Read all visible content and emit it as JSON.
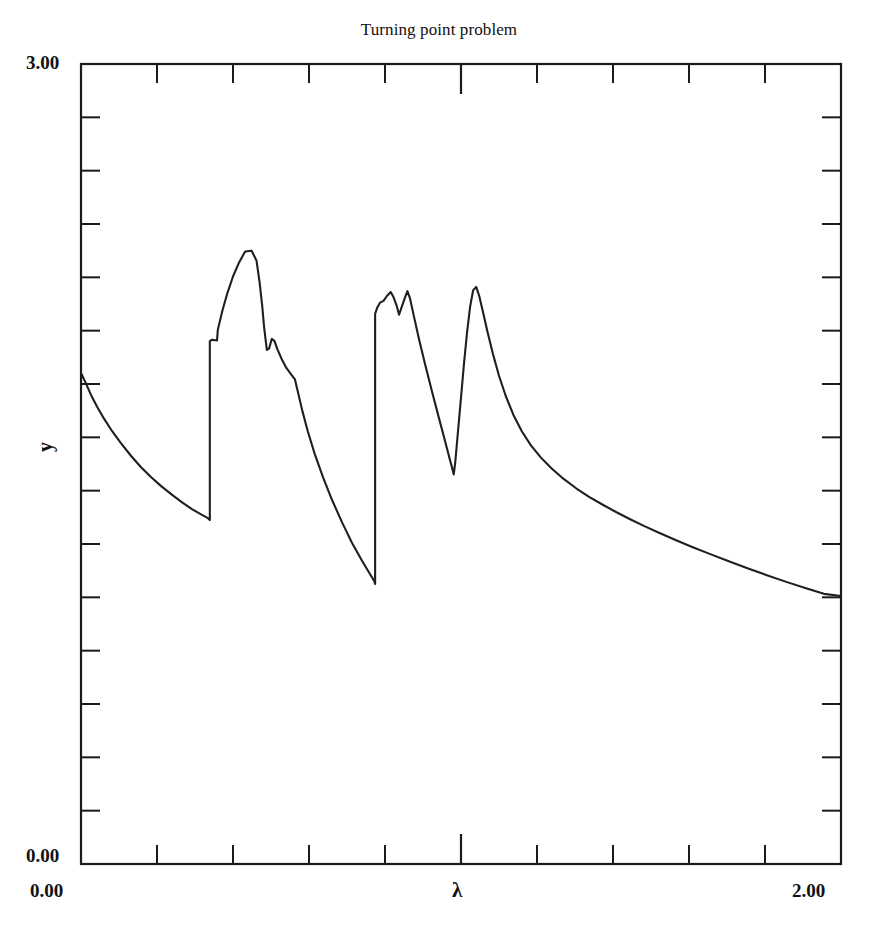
{
  "chart_data": {
    "type": "line",
    "title": "Turning point problem",
    "xlabel": "λ",
    "ylabel": "y",
    "xlim": [
      0.0,
      2.0
    ],
    "ylim": [
      0.0,
      3.0
    ],
    "grid": false,
    "legend": null,
    "x_tick_labels": [
      "0.00",
      "2.00"
    ],
    "y_tick_labels": [
      "0.00",
      "3.00"
    ],
    "x_tick_values": [
      0.0,
      0.2,
      0.4,
      0.6,
      0.8,
      1.0,
      1.2,
      1.4,
      1.6,
      1.8,
      2.0
    ],
    "y_tick_values": [
      0.0,
      0.2,
      0.4,
      0.6,
      0.8,
      1.0,
      1.2,
      1.4,
      1.6,
      1.8,
      2.0,
      2.2,
      2.4,
      2.6,
      2.8,
      3.0
    ],
    "x_major_tick_values": [
      1.0
    ],
    "y_major_tick_values": [
      1.5
    ],
    "series": [
      {
        "name": "y",
        "points": [
          [
            0.0,
            1.841
          ],
          [
            0.012,
            1.805
          ],
          [
            0.026,
            1.76
          ],
          [
            0.042,
            1.716
          ],
          [
            0.061,
            1.669
          ],
          [
            0.082,
            1.623
          ],
          [
            0.105,
            1.578
          ],
          [
            0.132,
            1.53
          ],
          [
            0.158,
            1.488
          ],
          [
            0.184,
            1.451
          ],
          [
            0.211,
            1.417
          ],
          [
            0.239,
            1.385
          ],
          [
            0.266,
            1.356
          ],
          [
            0.292,
            1.331
          ],
          [
            0.316,
            1.311
          ],
          [
            0.334,
            1.297
          ],
          [
            0.339,
            1.29
          ],
          [
            0.339,
            1.961
          ],
          [
            0.345,
            1.966
          ],
          [
            0.358,
            1.963
          ],
          [
            0.36,
            2.003
          ],
          [
            0.372,
            2.075
          ],
          [
            0.385,
            2.14
          ],
          [
            0.4,
            2.203
          ],
          [
            0.416,
            2.256
          ],
          [
            0.432,
            2.297
          ],
          [
            0.449,
            2.3
          ],
          [
            0.462,
            2.262
          ],
          [
            0.47,
            2.181
          ],
          [
            0.477,
            2.091
          ],
          [
            0.482,
            2.011
          ],
          [
            0.489,
            1.928
          ],
          [
            0.495,
            1.933
          ],
          [
            0.502,
            1.969
          ],
          [
            0.509,
            1.962
          ],
          [
            0.517,
            1.93
          ],
          [
            0.528,
            1.894
          ],
          [
            0.54,
            1.861
          ],
          [
            0.552,
            1.838
          ],
          [
            0.563,
            1.817
          ],
          [
            0.571,
            1.769
          ],
          [
            0.582,
            1.702
          ],
          [
            0.597,
            1.622
          ],
          [
            0.615,
            1.538
          ],
          [
            0.637,
            1.45
          ],
          [
            0.661,
            1.364
          ],
          [
            0.687,
            1.281
          ],
          [
            0.713,
            1.205
          ],
          [
            0.738,
            1.141
          ],
          [
            0.758,
            1.093
          ],
          [
            0.772,
            1.06
          ],
          [
            0.774,
            1.05
          ],
          [
            0.774,
            2.063
          ],
          [
            0.78,
            2.088
          ],
          [
            0.787,
            2.105
          ],
          [
            0.796,
            2.112
          ],
          [
            0.805,
            2.13
          ],
          [
            0.815,
            2.145
          ],
          [
            0.822,
            2.127
          ],
          [
            0.83,
            2.097
          ],
          [
            0.837,
            2.06
          ],
          [
            0.845,
            2.093
          ],
          [
            0.853,
            2.126
          ],
          [
            0.859,
            2.148
          ],
          [
            0.866,
            2.12
          ],
          [
            0.877,
            2.048
          ],
          [
            0.89,
            1.965
          ],
          [
            0.906,
            1.871
          ],
          [
            0.924,
            1.77
          ],
          [
            0.942,
            1.672
          ],
          [
            0.958,
            1.586
          ],
          [
            0.97,
            1.521
          ],
          [
            0.978,
            1.478
          ],
          [
            0.981,
            1.461
          ],
          [
            0.985,
            1.508
          ],
          [
            0.992,
            1.621
          ],
          [
            1.0,
            1.749
          ],
          [
            1.008,
            1.878
          ],
          [
            1.016,
            1.994
          ],
          [
            1.024,
            2.09
          ],
          [
            1.032,
            2.152
          ],
          [
            1.04,
            2.164
          ],
          [
            1.048,
            2.13
          ],
          [
            1.058,
            2.069
          ],
          [
            1.07,
            1.994
          ],
          [
            1.084,
            1.913
          ],
          [
            1.1,
            1.831
          ],
          [
            1.118,
            1.754
          ],
          [
            1.138,
            1.684
          ],
          [
            1.16,
            1.623
          ],
          [
            1.184,
            1.57
          ],
          [
            1.211,
            1.523
          ],
          [
            1.24,
            1.481
          ],
          [
            1.271,
            1.443
          ],
          [
            1.303,
            1.409
          ],
          [
            1.337,
            1.377
          ],
          [
            1.372,
            1.348
          ],
          [
            1.408,
            1.32
          ],
          [
            1.445,
            1.293
          ],
          [
            1.484,
            1.266
          ],
          [
            1.524,
            1.24
          ],
          [
            1.566,
            1.214
          ],
          [
            1.61,
            1.188
          ],
          [
            1.656,
            1.162
          ],
          [
            1.703,
            1.136
          ],
          [
            1.752,
            1.11
          ],
          [
            1.803,
            1.084
          ],
          [
            1.856,
            1.058
          ],
          [
            1.91,
            1.033
          ],
          [
            1.955,
            1.013
          ],
          [
            2.0,
            1.005
          ]
        ]
      }
    ]
  },
  "title": {
    "text": "Turning point problem"
  },
  "axes": {
    "y_max_label": "3.00",
    "y_min_label": "0.00",
    "x_min_label": "0.00",
    "x_max_label": "2.00",
    "x_axis_name": "λ",
    "y_axis_name": "y"
  },
  "colors": {
    "curve": "#1f1f1f",
    "frame": "#1a1a1a",
    "background": "#ffffff",
    "text": "#111111"
  }
}
